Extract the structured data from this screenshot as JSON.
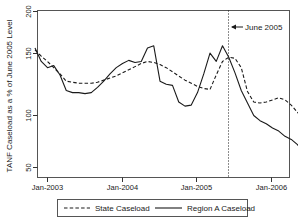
{
  "chart_data": {
    "type": "line",
    "title": "",
    "xlabel": "",
    "ylabel": "TANF Caseload as a % of June 2005 Level",
    "ylim": [
      35,
      205
    ],
    "yticks": [
      50,
      100,
      150,
      200
    ],
    "ytick_labels": [
      "50",
      "100",
      "150",
      "200"
    ],
    "xlim": [
      "2002-09",
      "2006-09"
    ],
    "xticks": [
      "Jan-2003",
      "Jan-2004",
      "Jan-2005",
      "Jan-2006"
    ],
    "grid": false,
    "legend_position": "bottom",
    "annotations": [
      {
        "name": "june-2005-marker",
        "label": "June 2005",
        "x": "2005-06",
        "style": "dotted-vline-with-left-arrow"
      }
    ],
    "series": [
      {
        "name": "State Caseload",
        "style": "dashed",
        "color": "#1a1a1a",
        "x": [
          "2002-11",
          "2002-12",
          "2003-01",
          "2003-02",
          "2003-03",
          "2003-04",
          "2003-05",
          "2003-06",
          "2003-07",
          "2003-08",
          "2003-09",
          "2003-10",
          "2003-11",
          "2003-12",
          "2004-01",
          "2004-02",
          "2004-03",
          "2004-04",
          "2004-05",
          "2004-06",
          "2004-07",
          "2004-08",
          "2004-09",
          "2004-10",
          "2004-11",
          "2004-12",
          "2005-01",
          "2005-02",
          "2005-03",
          "2005-04",
          "2005-05",
          "2005-06",
          "2005-07",
          "2005-08",
          "2005-09",
          "2005-10",
          "2005-11",
          "2005-12",
          "2006-01",
          "2006-02",
          "2006-03",
          "2006-04",
          "2006-05",
          "2006-06",
          "2006-07"
        ],
        "values": [
          163,
          157,
          152,
          146,
          140,
          133,
          132,
          131,
          131,
          131,
          132,
          134,
          136,
          138,
          141,
          144,
          147,
          150,
          152,
          151,
          149,
          146,
          142,
          138,
          134,
          131,
          128,
          126,
          125,
          139,
          152,
          156,
          155,
          146,
          123,
          113,
          112,
          113,
          115,
          117,
          115,
          110,
          103,
          97,
          93
        ]
      },
      {
        "name": "Region A Caseload",
        "style": "solid",
        "color": "#1a1a1a",
        "x": [
          "2002-11",
          "2002-12",
          "2003-01",
          "2003-02",
          "2003-03",
          "2003-04",
          "2003-05",
          "2003-06",
          "2003-07",
          "2003-08",
          "2003-09",
          "2003-10",
          "2003-11",
          "2003-12",
          "2004-01",
          "2004-02",
          "2004-03",
          "2004-04",
          "2004-05",
          "2004-06",
          "2004-07",
          "2004-08",
          "2004-09",
          "2004-10",
          "2004-11",
          "2004-12",
          "2005-01",
          "2005-02",
          "2005-03",
          "2005-04",
          "2005-05",
          "2005-06",
          "2005-07",
          "2005-08",
          "2005-09",
          "2005-10",
          "2005-11",
          "2005-12",
          "2006-01",
          "2006-02",
          "2006-03",
          "2006-04",
          "2006-05",
          "2006-06",
          "2006-07"
        ],
        "values": [
          165,
          152,
          146,
          148,
          139,
          124,
          122,
          122,
          121,
          122,
          127,
          133,
          140,
          146,
          150,
          153,
          151,
          152,
          165,
          167,
          133,
          130,
          129,
          113,
          109,
          110,
          122,
          140,
          160,
          152,
          167,
          156,
          141,
          124,
          112,
          100,
          95,
          92,
          88,
          85,
          80,
          77,
          72,
          64,
          57
        ]
      }
    ],
    "legend": [
      {
        "label": "State Caseload",
        "style": "dashed"
      },
      {
        "label": "Region A Caseload",
        "style": "solid"
      }
    ]
  },
  "axis": {
    "y_title": "TANF Caseload as a % of June 2005 Level",
    "ytick_0": "50",
    "ytick_1": "100",
    "ytick_2": "150",
    "ytick_3": "200",
    "xtick_0": "Jan-2003",
    "xtick_1": "Jan-2004",
    "xtick_2": "Jan-2005",
    "xtick_3": "Jan-2006"
  },
  "annotation": {
    "june_2005": "June 2005"
  },
  "legend": {
    "state_label": "State Caseload",
    "region_label": "Region A Caseload"
  },
  "colors": {
    "ink": "#1a1a1a",
    "frame": "#4a4a4a",
    "background": "#ffffff"
  }
}
